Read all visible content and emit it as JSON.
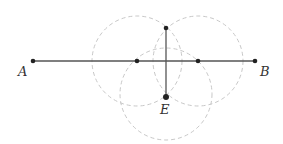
{
  "diagram": {
    "colors": {
      "segment": "#555555",
      "circle": "#c8c8c8",
      "point": "#222222",
      "label": "#333333"
    },
    "points": [
      {
        "id": "A",
        "label": "A",
        "x": 33,
        "y": 61,
        "lx": 18,
        "ly": 76
      },
      {
        "id": "B",
        "label": "B",
        "x": 255,
        "y": 61,
        "lx": 260,
        "ly": 76
      },
      {
        "id": "C",
        "label": "",
        "x": 137,
        "y": 61
      },
      {
        "id": "D",
        "label": "",
        "x": 198,
        "y": 61
      },
      {
        "id": "T",
        "label": "",
        "x": 166,
        "y": 28
      },
      {
        "id": "E",
        "label": "E",
        "x": 166,
        "y": 97,
        "lx": 160,
        "ly": 114
      }
    ],
    "segments": [
      {
        "from": "A",
        "to": "B"
      },
      {
        "from": "T",
        "to": "E"
      }
    ],
    "circles": [
      {
        "cx": 137,
        "cy": 61,
        "r": 45
      },
      {
        "cx": 198,
        "cy": 61,
        "r": 45
      },
      {
        "cx": 166,
        "cy": 94,
        "r": 46
      }
    ]
  }
}
